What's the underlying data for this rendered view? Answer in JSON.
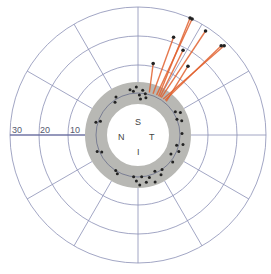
{
  "diagram": {
    "type": "polar-plot",
    "center": {
      "x": 138,
      "y": 135
    },
    "colors": {
      "grid": "#8a8fb5",
      "axis": "#5a5f95",
      "annulus": "#b8b8b4",
      "annulus_line": "#6a6e8a",
      "vector": "#e0602e",
      "point": "#222222",
      "background": "#ffffff"
    },
    "annulus": {
      "inner_r": 31,
      "mid_r": 42,
      "outer_r": 53
    },
    "rings": [
      {
        "value": "10",
        "r": 70
      },
      {
        "value": "20",
        "r": 99
      },
      {
        "value": "30",
        "r": 128
      }
    ],
    "spoke_angles_deg": [
      0,
      30,
      60,
      90,
      120,
      150,
      180,
      210,
      240,
      270,
      300,
      330
    ],
    "quadrant_labels": {
      "superior": "S",
      "nasal": "N",
      "temporal": "T",
      "inferior": "I"
    },
    "axis_labels": [
      "30",
      "20",
      "10"
    ]
  },
  "chart_data": {
    "type": "scatter",
    "title": "",
    "xlabel": "",
    "ylabel": "",
    "radial_ticks": [
      10,
      20,
      30
    ],
    "quadrants": [
      "S",
      "N",
      "T",
      "I"
    ],
    "vectors": [
      {
        "from_angle_deg": 65,
        "from_r": 44,
        "to_angle_deg": 65,
        "to_r": 128
      },
      {
        "from_angle_deg": 62,
        "from_r": 44,
        "to_angle_deg": 66,
        "to_r": 128
      },
      {
        "from_angle_deg": 58,
        "from_r": 44,
        "to_angle_deg": 57,
        "to_r": 124
      },
      {
        "from_angle_deg": 55,
        "from_r": 44,
        "to_angle_deg": 46,
        "to_r": 124
      },
      {
        "from_angle_deg": 52,
        "from_r": 44,
        "to_angle_deg": 47,
        "to_r": 122
      },
      {
        "from_angle_deg": 70,
        "from_r": 44,
        "to_angle_deg": 70,
        "to_r": 104
      },
      {
        "from_angle_deg": 60,
        "from_r": 44,
        "to_angle_deg": 62,
        "to_r": 96
      },
      {
        "from_angle_deg": 50,
        "from_r": 44,
        "to_angle_deg": 54,
        "to_r": 85
      },
      {
        "from_angle_deg": 75,
        "from_r": 44,
        "to_angle_deg": 78,
        "to_r": 73
      }
    ],
    "points_polar": [
      {
        "a": 92,
        "r": 48
      },
      {
        "a": 96,
        "r": 44
      },
      {
        "a": 100,
        "r": 46
      },
      {
        "a": 88,
        "r": 40
      },
      {
        "a": 84,
        "r": 45
      },
      {
        "a": 80,
        "r": 42
      },
      {
        "a": 78,
        "r": 38
      },
      {
        "a": 86,
        "r": 36
      },
      {
        "a": 120,
        "r": 44
      },
      {
        "a": 125,
        "r": 40
      },
      {
        "a": 160,
        "r": 40
      },
      {
        "a": 163,
        "r": 44
      },
      {
        "a": 32,
        "r": 44
      },
      {
        "a": 28,
        "r": 48
      },
      {
        "a": 22,
        "r": 42
      },
      {
        "a": 18,
        "r": 46
      },
      {
        "a": 2,
        "r": 44
      },
      {
        "a": -12,
        "r": 46
      },
      {
        "a": -15,
        "r": 40
      },
      {
        "a": -22,
        "r": 44
      },
      {
        "a": -30,
        "r": 38
      },
      {
        "a": -38,
        "r": 44
      },
      {
        "a": -55,
        "r": 42
      },
      {
        "a": -60,
        "r": 46
      },
      {
        "a": -65,
        "r": 40
      },
      {
        "a": -70,
        "r": 50
      },
      {
        "a": -75,
        "r": 44
      },
      {
        "a": -80,
        "r": 48
      },
      {
        "a": -85,
        "r": 42
      },
      {
        "a": -88,
        "r": 50
      },
      {
        "a": -92,
        "r": 46
      },
      {
        "a": -96,
        "r": 42
      },
      {
        "a": -118,
        "r": 44
      },
      {
        "a": -122,
        "r": 42
      },
      {
        "a": -155,
        "r": 40
      },
      {
        "a": -158,
        "r": 44
      }
    ]
  }
}
